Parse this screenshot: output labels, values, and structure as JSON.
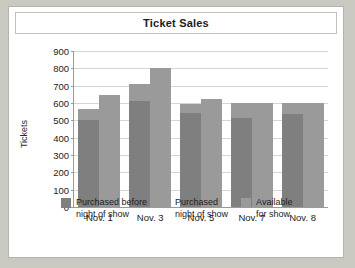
{
  "chart_data": {
    "type": "bar",
    "title": "Ticket Sales",
    "xlabel": "",
    "ylabel": "Tickets",
    "ylim": [
      0,
      900
    ],
    "yticks": [
      0,
      100,
      200,
      300,
      400,
      500,
      600,
      700,
      800,
      900
    ],
    "grid": true,
    "legend_position": "bottom",
    "stacked_groups": true,
    "categories": [
      "Nov. 1",
      "Nov. 3",
      "Nov. 5",
      "Nov. 7",
      "Nov. 8"
    ],
    "series": [
      {
        "name": "Purchased before night of show",
        "color": "#7f7f7f",
        "values": [
          500,
          610,
          545,
          515,
          535
        ]
      },
      {
        "name": "Purchased night of show",
        "color": "#9a9a9a",
        "values": [
          65,
          100,
          50,
          85,
          65
        ]
      },
      {
        "name": "Available for show",
        "color": "#9a9a9a",
        "values": [
          645,
          800,
          625,
          600,
          600
        ]
      }
    ],
    "group_totals_sold": [
      565,
      710,
      595,
      600,
      600
    ]
  },
  "legend": {
    "items": [
      {
        "label_line1": "Purchased before",
        "label_line2": "night of show",
        "color": "#7f7f7f"
      },
      {
        "label_line1": "Purchased",
        "label_line2": "night of show",
        "color": "#9a9a9a"
      },
      {
        "label_line1": "Available",
        "label_line2": "for show",
        "color": "#9a9a9a"
      }
    ]
  },
  "colors": {
    "dark_gray": "#7f7f7f",
    "light_gray": "#9a9a9a",
    "page_background": "#c9c9c2",
    "figure_background": "#ffffff",
    "gridline": "#d6d6d1",
    "axis": "#9b9b96"
  }
}
